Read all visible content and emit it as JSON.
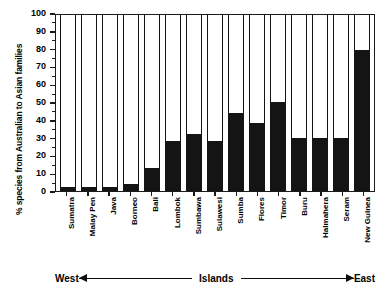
{
  "chart_data": {
    "type": "bar",
    "title": "",
    "xlabel": "Islands",
    "ylabel": "% species from Australian to Asian families",
    "ylim": [
      0,
      100
    ],
    "ytick_labels": [
      "0",
      "10",
      "20",
      "30",
      "40",
      "50",
      "60",
      "70",
      "80",
      "90",
      "100"
    ],
    "ytick_values": [
      0,
      10,
      20,
      30,
      40,
      50,
      60,
      70,
      80,
      90,
      100
    ],
    "grid": false,
    "legend": "none",
    "bar_color": "#141414",
    "categories": [
      "Sumatra",
      "Malay Pen",
      "Java",
      "Borneo",
      "Bali",
      "Lombok",
      "Sumbawa",
      "Sulawesi",
      "Sumba",
      "Flores",
      "Timor",
      "Buru",
      "Halmahera",
      "Seram",
      "New Guinea"
    ],
    "values": [
      2,
      2,
      2,
      4,
      13,
      28,
      32,
      28,
      44,
      38,
      50,
      30,
      30,
      30,
      79
    ],
    "annotations": {
      "west": "West",
      "east": "East",
      "axis_middle": "Islands"
    }
  }
}
